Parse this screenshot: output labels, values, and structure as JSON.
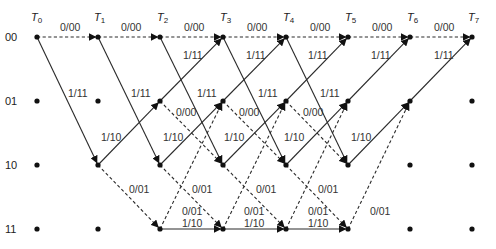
{
  "colors": {
    "line": "#2a2a2a",
    "node": "#111111",
    "text": "#222222",
    "background": "#ffffff"
  },
  "legend": {
    "dashed": "input bit 0",
    "solid": "input bit 1"
  },
  "time_labels": [
    {
      "id": "T0",
      "letter": "T",
      "sub": "0"
    },
    {
      "id": "T1",
      "letter": "T",
      "sub": "1"
    },
    {
      "id": "T2",
      "letter": "T",
      "sub": "2"
    },
    {
      "id": "T3",
      "letter": "T",
      "sub": "3"
    },
    {
      "id": "T4",
      "letter": "T",
      "sub": "4"
    },
    {
      "id": "T5",
      "letter": "T",
      "sub": "5"
    },
    {
      "id": "T6",
      "letter": "T",
      "sub": "6"
    },
    {
      "id": "T7",
      "letter": "T",
      "sub": "7"
    }
  ],
  "states": [
    "00",
    "01",
    "10",
    "11"
  ],
  "layout": {
    "x": [
      37,
      98,
      160,
      223,
      286,
      348,
      410,
      472
    ],
    "y": {
      "00": 37,
      "01": 101,
      "10": 165,
      "11": 229
    }
  },
  "transitions": {
    "00->00": {
      "label": "0/00",
      "style": "dashed"
    },
    "00->10": {
      "label": "1/11",
      "style": "solid"
    },
    "01->00": {
      "label": "1/11",
      "style": "solid"
    },
    "01->10": {
      "label": "0/00",
      "style": "dashed"
    },
    "10->01": {
      "label": "1/10",
      "style": "solid"
    },
    "10->11": {
      "label": "0/01",
      "style": "dashed"
    },
    "11->01": {
      "label": "0/01",
      "style": "dashed"
    },
    "11->11": {
      "label": "1/10",
      "style": "solid"
    }
  },
  "edges": [
    {
      "t": 0,
      "from": "00",
      "to": "00"
    },
    {
      "t": 0,
      "from": "00",
      "to": "10"
    },
    {
      "t": 1,
      "from": "00",
      "to": "00"
    },
    {
      "t": 1,
      "from": "00",
      "to": "10"
    },
    {
      "t": 1,
      "from": "10",
      "to": "01"
    },
    {
      "t": 1,
      "from": "10",
      "to": "11"
    },
    {
      "t": 2,
      "from": "00",
      "to": "00"
    },
    {
      "t": 2,
      "from": "00",
      "to": "10"
    },
    {
      "t": 2,
      "from": "01",
      "to": "00"
    },
    {
      "t": 2,
      "from": "01",
      "to": "10"
    },
    {
      "t": 2,
      "from": "10",
      "to": "01"
    },
    {
      "t": 2,
      "from": "10",
      "to": "11"
    },
    {
      "t": 2,
      "from": "11",
      "to": "01"
    },
    {
      "t": 2,
      "from": "11",
      "to": "11"
    },
    {
      "t": 3,
      "from": "00",
      "to": "00"
    },
    {
      "t": 3,
      "from": "00",
      "to": "10"
    },
    {
      "t": 3,
      "from": "01",
      "to": "00"
    },
    {
      "t": 3,
      "from": "01",
      "to": "10"
    },
    {
      "t": 3,
      "from": "10",
      "to": "01"
    },
    {
      "t": 3,
      "from": "10",
      "to": "11"
    },
    {
      "t": 3,
      "from": "11",
      "to": "01"
    },
    {
      "t": 3,
      "from": "11",
      "to": "11"
    },
    {
      "t": 4,
      "from": "00",
      "to": "00"
    },
    {
      "t": 4,
      "from": "00",
      "to": "10"
    },
    {
      "t": 4,
      "from": "01",
      "to": "00"
    },
    {
      "t": 4,
      "from": "01",
      "to": "10"
    },
    {
      "t": 4,
      "from": "10",
      "to": "01"
    },
    {
      "t": 4,
      "from": "10",
      "to": "11"
    },
    {
      "t": 4,
      "from": "11",
      "to": "01"
    },
    {
      "t": 4,
      "from": "11",
      "to": "11"
    },
    {
      "t": 5,
      "from": "00",
      "to": "00"
    },
    {
      "t": 5,
      "from": "01",
      "to": "00"
    },
    {
      "t": 5,
      "from": "10",
      "to": "01"
    },
    {
      "t": 5,
      "from": "11",
      "to": "01"
    },
    {
      "t": 6,
      "from": "00",
      "to": "00"
    },
    {
      "t": 6,
      "from": "01",
      "to": "00"
    }
  ],
  "edge_labels": [
    {
      "text": "0/00",
      "x": 60,
      "y": 31
    },
    {
      "text": "0/00",
      "x": 121,
      "y": 31
    },
    {
      "text": "0/00",
      "x": 184,
      "y": 31
    },
    {
      "text": "0/00",
      "x": 247,
      "y": 31
    },
    {
      "text": "0/00",
      "x": 310,
      "y": 31
    },
    {
      "text": "0/00",
      "x": 372,
      "y": 31
    },
    {
      "text": "0/00",
      "x": 434,
      "y": 31
    },
    {
      "text": "1/11",
      "x": 183,
      "y": 59
    },
    {
      "text": "1/11",
      "x": 246,
      "y": 59
    },
    {
      "text": "1/11",
      "x": 308,
      "y": 59
    },
    {
      "text": "1/11",
      "x": 371,
      "y": 59
    },
    {
      "text": "1/11",
      "x": 434,
      "y": 59
    },
    {
      "text": "1/11",
      "x": 68,
      "y": 97
    },
    {
      "text": "1/11",
      "x": 131,
      "y": 97
    },
    {
      "text": "1/11",
      "x": 197,
      "y": 97
    },
    {
      "text": "1/11",
      "x": 258,
      "y": 97
    },
    {
      "text": "1/11",
      "x": 320,
      "y": 97
    },
    {
      "text": "0/00",
      "x": 176,
      "y": 116
    },
    {
      "text": "0/00",
      "x": 239,
      "y": 116
    },
    {
      "text": "0/00",
      "x": 303,
      "y": 116
    },
    {
      "text": "1/10",
      "x": 101,
      "y": 141
    },
    {
      "text": "1/10",
      "x": 163,
      "y": 141
    },
    {
      "text": "1/10",
      "x": 224,
      "y": 141
    },
    {
      "text": "1/10",
      "x": 284,
      "y": 141
    },
    {
      "text": "1/10",
      "x": 351,
      "y": 141
    },
    {
      "text": "0/01",
      "x": 129,
      "y": 193
    },
    {
      "text": "0/01",
      "x": 192,
      "y": 193
    },
    {
      "text": "0/01",
      "x": 256,
      "y": 193
    },
    {
      "text": "0/01",
      "x": 318,
      "y": 193
    },
    {
      "text": "0/01",
      "x": 182,
      "y": 215
    },
    {
      "text": "0/01",
      "x": 244,
      "y": 215
    },
    {
      "text": "0/01",
      "x": 308,
      "y": 215
    },
    {
      "text": "0/01",
      "x": 370,
      "y": 215
    },
    {
      "text": "1/10",
      "x": 182,
      "y": 227
    },
    {
      "text": "1/10",
      "x": 244,
      "y": 227
    },
    {
      "text": "1/10",
      "x": 308,
      "y": 227
    }
  ]
}
